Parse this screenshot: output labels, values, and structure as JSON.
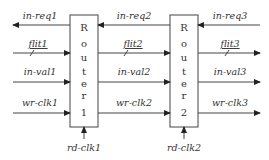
{
  "diagram": {
    "type": "router-chain",
    "routers": [
      {
        "id": "router-1",
        "letters": [
          "R",
          "o",
          "u",
          "t",
          "e",
          "r"
        ],
        "number": "1",
        "clock": "rd-clk1"
      },
      {
        "id": "router-2",
        "letters": [
          "R",
          "o",
          "u",
          "t",
          "e",
          "r"
        ],
        "number": "2",
        "clock": "rd-clk2"
      }
    ],
    "signals": {
      "left": {
        "req": "in-req1",
        "flit": "flit1",
        "val": "in-val1",
        "clk": "wr-clk1"
      },
      "middle": {
        "req": "in-req2",
        "flit": "flit2",
        "val": "in-val2",
        "clk": "wr-clk2"
      },
      "right": {
        "req": "in-req3",
        "flit": "flit3",
        "val": "in-val3",
        "clk": "wr-clk3"
      }
    },
    "colors": {
      "line": "#333333",
      "box_fill": "#ffffff",
      "text": "#333333"
    }
  }
}
